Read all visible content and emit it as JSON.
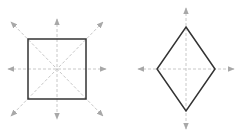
{
  "diagram": {
    "colors": {
      "shape_stroke": "#333333",
      "axis_line": "#c8c8c8",
      "arrow_fill": "#a8a8a8",
      "background": "#ffffff"
    },
    "figures": [
      {
        "name": "square",
        "axes_count": 4,
        "axes": [
          "vertical",
          "horizontal",
          "diagonal",
          "anti-diagonal"
        ]
      },
      {
        "name": "rhombus",
        "axes_count": 2,
        "axes": [
          "vertical",
          "horizontal"
        ]
      }
    ]
  }
}
